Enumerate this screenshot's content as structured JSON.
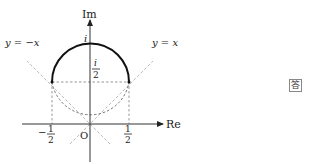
{
  "diagram": {
    "axes": {
      "x_label": "Re",
      "y_label": "Im",
      "origin_label": "O"
    },
    "lines": {
      "y_eq_x": "y = x",
      "y_eq_neg_x": "y = −x"
    },
    "points": {
      "top": "i",
      "center_num": "i",
      "center_den": "2",
      "left_num": "1",
      "left_den": "2",
      "left_sign": "−",
      "right_num": "1",
      "right_den": "2"
    }
  },
  "answer_badge": "答",
  "colors": {
    "curve": "#111111",
    "axis": "#333333",
    "dashed": "#aaaaaa"
  }
}
